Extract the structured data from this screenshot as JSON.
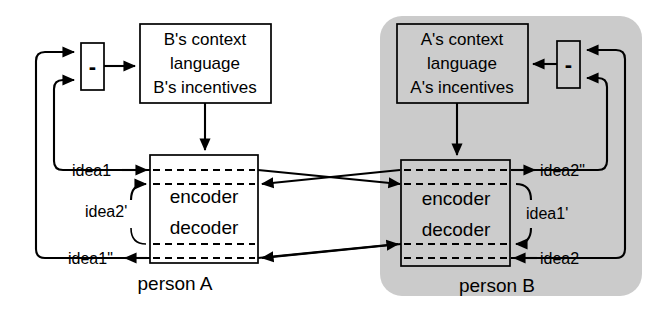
{
  "diagram": {
    "colors": {
      "background": "#ffffff",
      "panel_gray": "#cbcbcb",
      "stroke": "#000000",
      "box_fill_white": "#ffffff",
      "box_fill_gray": "#cccccc"
    },
    "person_a": {
      "person_label": "person A",
      "codec_top_label": "encoder",
      "codec_bottom_label": "decoder",
      "comparator_label": "-",
      "context_box": {
        "line1": "B's context",
        "line2": "language",
        "line3": "B's incentives"
      },
      "signals": {
        "input_top": "idea1",
        "feedback_mid": "idea2'",
        "output_bottom": "idea1\""
      }
    },
    "person_b": {
      "person_label": "person B",
      "codec_top_label": "encoder",
      "codec_bottom_label": "decoder",
      "comparator_label": "-",
      "context_box": {
        "line1": "A's context",
        "line2": "language",
        "line3": "A's incentives"
      },
      "signals": {
        "output_top": "idea2\"",
        "feedback_mid": "idea1'",
        "input_bottom": "idea2"
      }
    }
  }
}
